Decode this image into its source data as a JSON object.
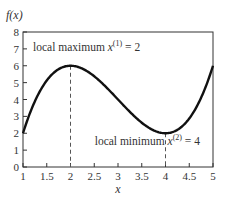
{
  "chart_data": {
    "type": "line",
    "title": "",
    "xlabel": "x",
    "ylabel": "f(x)",
    "xlim": [
      1,
      5
    ],
    "ylim": [
      0,
      8
    ],
    "x_ticks": [
      "1",
      "1.5",
      "2",
      "2.5",
      "3",
      "3.5",
      "4",
      "4.5",
      "5"
    ],
    "y_ticks": [
      "0",
      "1",
      "2",
      "3",
      "4",
      "5",
      "6",
      "7",
      "8"
    ],
    "grid": false,
    "series": [
      {
        "name": "f(x)",
        "x": [
          1,
          1.5,
          2,
          2.5,
          3,
          3.5,
          4,
          4.5,
          5
        ],
        "values": [
          2,
          4.875,
          6,
          5.625,
          4,
          2.375,
          2,
          3.125,
          6
        ]
      }
    ],
    "annotations": [
      {
        "label": "local maximum",
        "var": "x",
        "sup": "(1)",
        "eq": " = 2",
        "x": 2,
        "y": 6
      },
      {
        "label": "local minimum",
        "var": "x",
        "sup": "(2)",
        "eq": " = 4",
        "x": 4,
        "y": 2
      }
    ]
  }
}
